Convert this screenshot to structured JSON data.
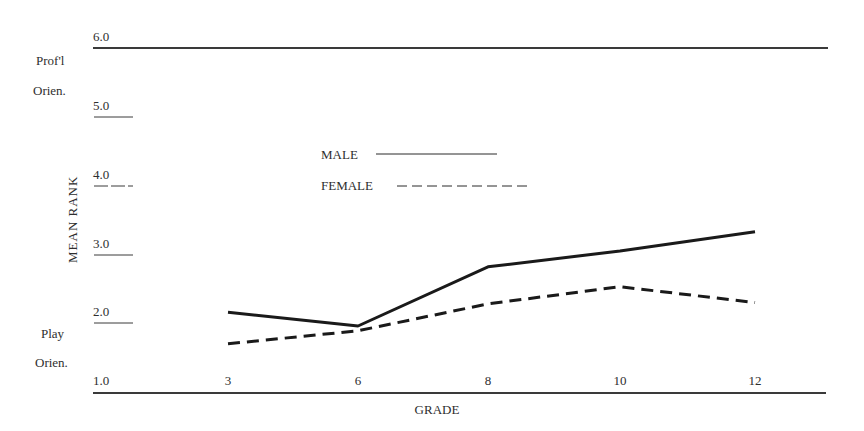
{
  "chart_data": {
    "type": "line",
    "title": "",
    "xlabel": "GRADE",
    "ylabel": "MEAN RANK",
    "categories": [
      "3",
      "6",
      "8",
      "10",
      "12"
    ],
    "y_ticks": [
      "1.0",
      "2.0",
      "3.0",
      "4.0",
      "5.0",
      "6.0"
    ],
    "ylim": [
      1.0,
      6.0
    ],
    "grid": false,
    "y_annotations": {
      "top": [
        "Prof'l",
        "Orien."
      ],
      "bottom": [
        "Play",
        "Orien."
      ]
    },
    "legend": {
      "position": "inside-center",
      "entries": [
        {
          "label": "MALE",
          "style": "solid"
        },
        {
          "label": "FEMALE",
          "style": "dashed"
        }
      ]
    },
    "series": [
      {
        "name": "MALE",
        "style": "solid",
        "values": [
          2.16,
          1.96,
          2.82,
          3.05,
          3.33
        ]
      },
      {
        "name": "FEMALE",
        "style": "dashed",
        "values": [
          1.7,
          1.89,
          2.28,
          2.53,
          2.3
        ]
      }
    ]
  },
  "colors": {
    "line": "#1a1a1a",
    "text": "#2e2e2e",
    "axis": "#3a3a3a",
    "background": "#ffffff"
  }
}
